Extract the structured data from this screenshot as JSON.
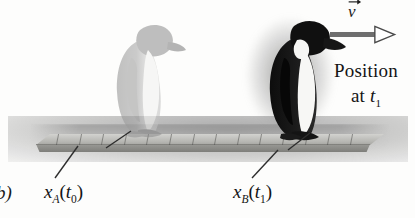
{
  "figure": {
    "panel_label": "b)",
    "type": "physics-displacement-diagram"
  },
  "annotations": {
    "velocity_vector": {
      "symbol": "v",
      "arrow_direction": "right",
      "icon": "vector-arrow-right-icon"
    },
    "caption_line1": "Position",
    "caption_line2_prefix": "at ",
    "caption_line2_symbol": "t",
    "caption_line2_subscript": "1"
  },
  "labels": {
    "left": {
      "symbol": "x",
      "subscript": "A",
      "open": "(",
      "time_symbol": "t",
      "time_subscript": "0",
      "close": ")",
      "full": "xA(t0)"
    },
    "right": {
      "symbol": "x",
      "subscript": "B",
      "open": "(",
      "time_symbol": "t",
      "time_subscript": "1",
      "close": ")",
      "full": "xB(t1)"
    }
  },
  "objects": {
    "penguin_past": {
      "name": "penguin-at-t0",
      "shade": "faded-gray"
    },
    "penguin_now": {
      "name": "penguin-at-t1",
      "shade": "black"
    },
    "plank": {
      "name": "measuring-plank",
      "tick_count": 14
    }
  },
  "colors": {
    "background": "#fdfdfc",
    "ink": "#141414",
    "plank_top": "#c4c4c0",
    "plank_front": "#8b8b87",
    "ground_shadow": "#8a8a8a",
    "arrow_shaft": "#6e6e6e",
    "penguin_dark": "#121212",
    "penguin_faded": "#9a9a9a"
  }
}
